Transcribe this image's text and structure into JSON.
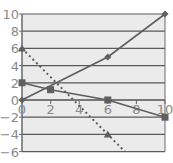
{
  "chart_data": {
    "type": "line",
    "title": "",
    "xlabel": "",
    "ylabel": "",
    "xlim": [
      0,
      10
    ],
    "ylim": [
      -6,
      10
    ],
    "grid": "horizontal",
    "legend": "none",
    "x_ticks": [
      "0",
      "2",
      "4",
      "6",
      "8",
      "10"
    ],
    "y_ticks": [
      "10",
      "8",
      "6",
      "4",
      "2",
      "0",
      "-2",
      "-4",
      "-6"
    ],
    "series": [
      {
        "name": "line-diamond",
        "marker": "diamond",
        "style": "solid",
        "points": [
          [
            0,
            0
          ],
          [
            6,
            5
          ],
          [
            10,
            10
          ]
        ]
      },
      {
        "name": "line-square",
        "marker": "square",
        "style": "solid",
        "points": [
          [
            0,
            2
          ],
          [
            2,
            1.2
          ],
          [
            6,
            0
          ],
          [
            10,
            -2
          ]
        ]
      },
      {
        "name": "line-triangle",
        "marker": "triangle",
        "style": "dotted",
        "points": [
          [
            0,
            6
          ],
          [
            6,
            -4
          ],
          [
            7.2,
            -6
          ]
        ]
      }
    ]
  },
  "colors": {
    "plot_bg": "#ebebeb",
    "grid": "#5a5a5a",
    "axis": "#6a6a6a",
    "series": "#5f5f5f",
    "tick_text": "#8a8a8a"
  }
}
